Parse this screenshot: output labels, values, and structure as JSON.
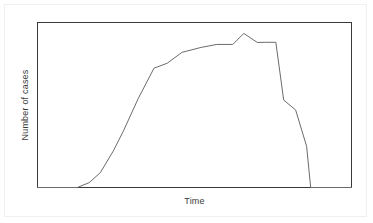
{
  "chart_data": {
    "type": "line",
    "title": "",
    "subtitle": "",
    "xlabel": "Time",
    "ylabel": "Number of cases",
    "grid": false,
    "legend": null,
    "axis_ticks": {
      "x": [],
      "y": []
    },
    "xlim": [
      0,
      100
    ],
    "ylim": [
      0,
      100
    ],
    "series": [
      {
        "name": "Number of cases",
        "color": "#6b6b6b",
        "x": [
          0.0,
          12.7,
          16.5,
          20.0,
          24.1,
          27.3,
          32.1,
          37.1,
          41.3,
          46.0,
          52.1,
          57.1,
          62.2,
          65.7,
          70.0,
          72.4,
          75.9,
          78.4,
          82.2,
          85.7,
          87.0,
          100.0
        ],
        "y": [
          0.0,
          0.0,
          3.0,
          9.0,
          22.0,
          34.0,
          54.0,
          72.3,
          75.3,
          81.9,
          84.9,
          86.7,
          86.7,
          93.4,
          87.9,
          88.0,
          88.0,
          53.0,
          47.0,
          25.0,
          0.0,
          0.0
        ]
      }
    ]
  },
  "figure": {
    "plot_frame": {
      "stroke": "#3a3a3a",
      "fill": "#ffffff"
    },
    "background": "#ffffff",
    "outer_border_color": "#f0f0f0"
  }
}
